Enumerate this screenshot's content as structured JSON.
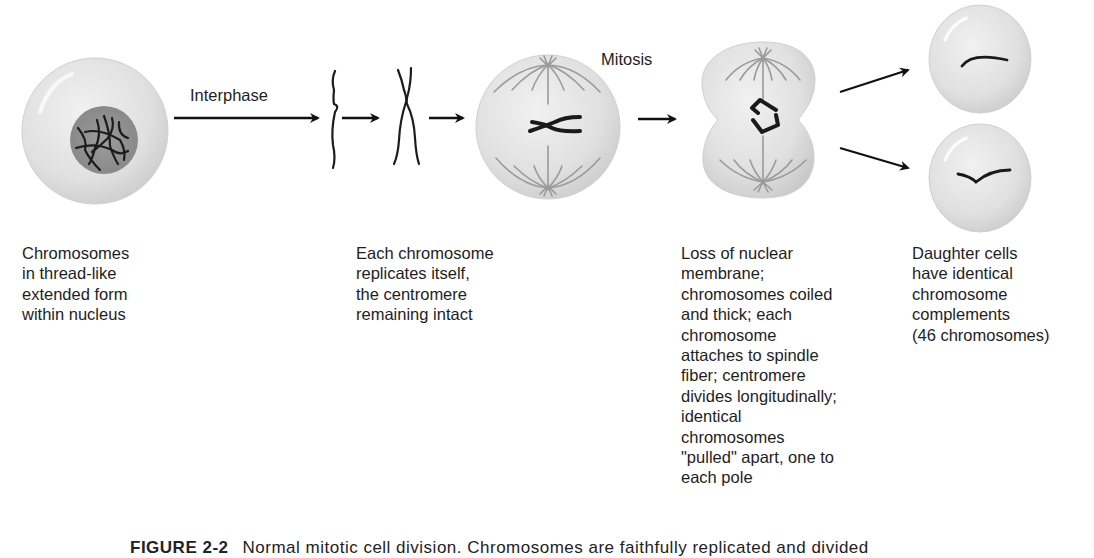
{
  "figure": {
    "stage_labels": {
      "interphase": "Interphase",
      "mitosis": "Mitosis"
    },
    "steps": [
      {
        "id": "interphase-cell",
        "caption": "Chromosomes\nin thread-like\nextended form\nwithin nucleus"
      },
      {
        "id": "replication",
        "caption": "Each chromosome\nreplicates itself,\nthe centromere\nremaining intact"
      },
      {
        "id": "anaphase-cell",
        "caption": "Loss of nuclear\nmembrane;\nchromosomes coiled\nand thick; each\nchromosome\nattaches to spindle\nfiber; centromere\ndivides longitudinally;\nidentical\nchromosomes\n\"pulled\" apart, one to\neach pole"
      },
      {
        "id": "daughter-cells",
        "caption": "Daughter cells\nhave identical\nchromosome\ncomplements\n(46 chromosomes)"
      }
    ],
    "caption": {
      "number": "FIGURE 2-2",
      "text": "Normal mitotic cell division. Chromosomes are faithfully replicated and divided"
    },
    "colors": {
      "cell_fill": "#e2e2e2",
      "cell_edge": "#c8c8c8",
      "nucleus": "#8e8e8e",
      "chromosome": "#1a1a1a",
      "spindle": "#9a9a9a",
      "arrow": "#111111"
    }
  }
}
